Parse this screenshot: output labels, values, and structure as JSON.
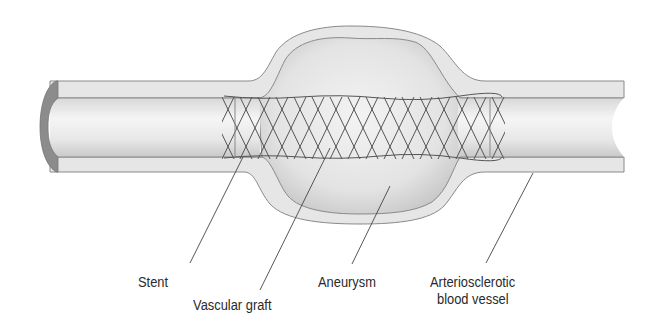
{
  "figure": {
    "colors": {
      "wall_fill": "#e6e6e6",
      "wall_outline": "#8a8a8a",
      "lumen_light": "#f4f4f4",
      "lumen_shade": "#cfcfcf",
      "cut_edge": "#8c8c8c",
      "mesh": "#555555",
      "leader_line": "#444444",
      "text": "#2a2a2a"
    }
  },
  "labels": {
    "stent": "Stent",
    "vascular_graft": "Vascular graft",
    "aneurysm": "Aneurysm",
    "vessel_line1": "Arteriosclerotic",
    "vessel_line2": "blood vessel"
  }
}
